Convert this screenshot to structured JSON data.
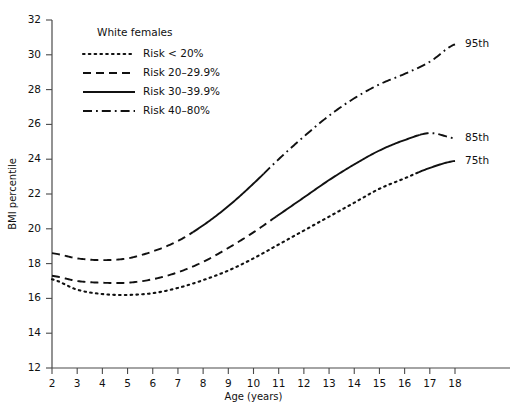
{
  "chart_data": {
    "type": "line",
    "title": "",
    "subtitle": "White females",
    "xlabel": "Age (years)",
    "ylabel": "BMI percentile",
    "xlim": [
      2,
      18
    ],
    "ylim": [
      12,
      32
    ],
    "xticks": [
      2,
      3,
      4,
      5,
      6,
      7,
      8,
      9,
      10,
      11,
      12,
      13,
      14,
      15,
      16,
      17,
      18
    ],
    "yticks": [
      12,
      14,
      16,
      18,
      20,
      22,
      24,
      26,
      28,
      30,
      32
    ],
    "grid": false,
    "legend_position": "top-left",
    "legend_title": "White females",
    "legend": [
      {
        "label": "Risk < 20%",
        "style": "dotted"
      },
      {
        "label": "Risk 20–29.9%",
        "style": "dashed"
      },
      {
        "label": "Risk 30–39.9%",
        "style": "solid"
      },
      {
        "label": "Risk 40–80%",
        "style": "dashdot"
      }
    ],
    "note": "Each percentile curve changes line style along its length to encode the obesity-risk band at that age.",
    "x": [
      2,
      3,
      4,
      5,
      6,
      7,
      8,
      9,
      10,
      11,
      12,
      13,
      14,
      15,
      16,
      17,
      18
    ],
    "series": [
      {
        "name": "95th",
        "end_label": "95th",
        "values": [
          18.6,
          18.3,
          18.2,
          18.3,
          18.7,
          19.3,
          20.2,
          21.3,
          22.6,
          24.0,
          25.3,
          26.5,
          27.5,
          28.3,
          28.9,
          29.6,
          30.6
        ],
        "style_segments": [
          {
            "from": 2,
            "to": 7.6,
            "style": "dashed"
          },
          {
            "from": 7.6,
            "to": 10.4,
            "style": "solid"
          },
          {
            "from": 10.4,
            "to": 18,
            "style": "dashdot"
          }
        ]
      },
      {
        "name": "85th",
        "end_label": "85th",
        "values": [
          17.3,
          17.0,
          16.9,
          16.9,
          17.1,
          17.5,
          18.1,
          18.9,
          19.8,
          20.8,
          21.8,
          22.8,
          23.7,
          24.5,
          25.1,
          25.5,
          25.2
        ],
        "style_segments": [
          {
            "from": 2,
            "to": 10.9,
            "style": "dashed"
          },
          {
            "from": 10.9,
            "to": 16.6,
            "style": "solid"
          },
          {
            "from": 16.6,
            "to": 18,
            "style": "dashdot"
          }
        ]
      },
      {
        "name": "75th",
        "end_label": "75th",
        "values": [
          17.1,
          16.5,
          16.25,
          16.2,
          16.3,
          16.6,
          17.05,
          17.6,
          18.3,
          19.1,
          19.9,
          20.7,
          21.5,
          22.3,
          22.9,
          23.5,
          23.9
        ],
        "style_segments": [
          {
            "from": 2,
            "to": 16.5,
            "style": "dotted"
          },
          {
            "from": 16.5,
            "to": 18,
            "style": "solid"
          }
        ]
      }
    ],
    "colors": {
      "line": "#111111",
      "axis": "#4a4a4a",
      "background": "#ffffff"
    }
  }
}
